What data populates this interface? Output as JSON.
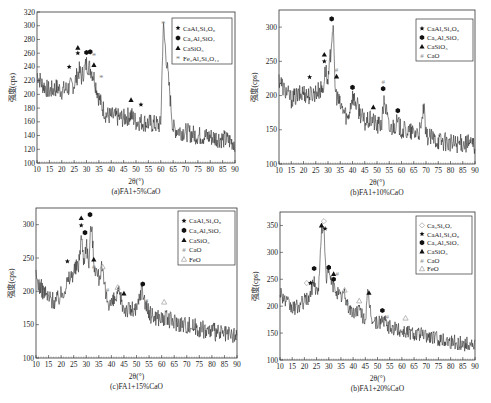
{
  "chart_data": [
    {
      "type": "line",
      "panel": "a",
      "caption": "(a)FA1+5%CaO",
      "xlabel": "2θ(°)",
      "ylabel": "强度(cps)",
      "xlim": [
        10,
        90
      ],
      "ylim": [
        100,
        320
      ],
      "xticks": [
        10,
        15,
        20,
        25,
        30,
        35,
        40,
        45,
        50,
        55,
        60,
        65,
        70,
        75,
        80,
        85,
        90
      ],
      "yticks": [
        100,
        120,
        140,
        160,
        180,
        200,
        220,
        240,
        260,
        280,
        300,
        320
      ],
      "grid": false,
      "legend_position": "upper right",
      "legend": [
        {
          "marker": "star",
          "label": "CaAl₂Si₂O₈"
        },
        {
          "marker": "hexagon",
          "label": "Ca₂Al₂SiO₇"
        },
        {
          "marker": "triangle",
          "label": "CaSiO₃"
        },
        {
          "marker": "asterisk-gray",
          "label": "Fe₃Al₂Si₃O₁₂"
        }
      ],
      "series": [
        {
          "name": "XRD pattern",
          "x": [
            10,
            12,
            15,
            18,
            20,
            23,
            25,
            27,
            28,
            30,
            31,
            32,
            33,
            34,
            35,
            36,
            38,
            40,
            45,
            48,
            50,
            52,
            55,
            60,
            61,
            65,
            70,
            75,
            80,
            85,
            90
          ],
          "values": [
            230,
            215,
            205,
            210,
            205,
            210,
            215,
            235,
            225,
            245,
            240,
            235,
            225,
            210,
            195,
            185,
            170,
            168,
            165,
            170,
            160,
            160,
            158,
            155,
            300,
            150,
            145,
            140,
            138,
            135,
            130
          ]
        }
      ],
      "annotations": [
        {
          "x": 23,
          "y": 240,
          "marker": "star"
        },
        {
          "x": 26.5,
          "y": 268,
          "marker": "triangle"
        },
        {
          "x": 26.5,
          "y": 260,
          "marker": "star"
        },
        {
          "x": 30,
          "y": 261,
          "marker": "hexagon"
        },
        {
          "x": 31.5,
          "y": 262,
          "marker": "hexagon"
        },
        {
          "x": 33,
          "y": 256,
          "marker": "asterisk-gray"
        },
        {
          "x": 33,
          "y": 243,
          "marker": "triangle"
        },
        {
          "x": 36,
          "y": 225,
          "marker": "asterisk-gray"
        },
        {
          "x": 48,
          "y": 192,
          "marker": "triangle"
        },
        {
          "x": 52,
          "y": 185,
          "marker": "star"
        },
        {
          "x": 61,
          "y": 303,
          "marker": "asterisk-gray"
        }
      ]
    },
    {
      "type": "line",
      "panel": "b",
      "caption": "(b)FA1+10%CaO",
      "xlabel": "2θ(°)",
      "ylabel": "强度(cps)",
      "xlim": [
        10,
        90
      ],
      "ylim": [
        100,
        325
      ],
      "xticks": [
        10,
        15,
        20,
        25,
        30,
        35,
        40,
        45,
        50,
        55,
        60,
        65,
        70,
        75,
        80,
        85,
        90
      ],
      "yticks": [
        100,
        150,
        200,
        250,
        300
      ],
      "grid": false,
      "legend_position": "upper right",
      "legend": [
        {
          "marker": "star",
          "label": "CaAl₂Si₂O₈"
        },
        {
          "marker": "hexagon",
          "label": "Ca₂Al₂SiO₇"
        },
        {
          "marker": "triangle",
          "label": "CaSiO₃"
        },
        {
          "marker": "hash",
          "label": "CaO"
        }
      ],
      "series": [
        {
          "name": "XRD pattern",
          "x": [
            10,
            12,
            15,
            18,
            20,
            22,
            25,
            28,
            29,
            30,
            32,
            33,
            35,
            37,
            38,
            40,
            45,
            48,
            50,
            52,
            53,
            55,
            58,
            60,
            65,
            68,
            69,
            70,
            75,
            80,
            85,
            90
          ],
          "values": [
            225,
            210,
            195,
            200,
            205,
            200,
            205,
            210,
            240,
            215,
            305,
            205,
            185,
            175,
            165,
            200,
            160,
            165,
            155,
            160,
            195,
            150,
            160,
            150,
            145,
            148,
            185,
            140,
            135,
            130,
            130,
            128
          ]
        }
      ],
      "annotations": [
        {
          "x": 22.5,
          "y": 227,
          "marker": "star"
        },
        {
          "x": 28.5,
          "y": 260,
          "marker": "triangle"
        },
        {
          "x": 28.5,
          "y": 250,
          "marker": "star"
        },
        {
          "x": 31.5,
          "y": 312,
          "marker": "hexagon"
        },
        {
          "x": 33.5,
          "y": 238,
          "marker": "hash"
        },
        {
          "x": 33.5,
          "y": 228,
          "marker": "triangle"
        },
        {
          "x": 40,
          "y": 212,
          "marker": "hexagon"
        },
        {
          "x": 48.5,
          "y": 183,
          "marker": "triangle"
        },
        {
          "x": 52.5,
          "y": 220,
          "marker": "hash"
        },
        {
          "x": 52.5,
          "y": 210,
          "marker": "hexagon"
        },
        {
          "x": 58.5,
          "y": 178,
          "marker": "hexagon"
        }
      ]
    },
    {
      "type": "line",
      "panel": "c",
      "caption": "(c)FA1+15%CaO",
      "xlabel": "2θ(°)",
      "ylabel": "强度(cps)",
      "xlim": [
        10,
        90
      ],
      "ylim": [
        100,
        325
      ],
      "xticks": [
        10,
        15,
        20,
        25,
        30,
        35,
        40,
        45,
        50,
        55,
        60,
        65,
        70,
        75,
        80,
        85,
        90
      ],
      "yticks": [
        100,
        150,
        200,
        250,
        300
      ],
      "grid": false,
      "legend_position": "upper right",
      "legend": [
        {
          "marker": "star",
          "label": "CaAl₂Si₂O₈"
        },
        {
          "marker": "hexagon",
          "label": "Ca₂Al₂SiO₇"
        },
        {
          "marker": "triangle",
          "label": "CaSiO₃"
        },
        {
          "marker": "hash",
          "label": "CaO"
        },
        {
          "marker": "triangle-open",
          "label": "FeO"
        }
      ],
      "series": [
        {
          "name": "XRD pattern",
          "x": [
            10,
            12,
            15,
            18,
            20,
            22,
            25,
            27,
            28,
            29,
            30,
            31,
            32,
            33,
            34,
            35,
            36,
            38,
            40,
            43,
            45,
            48,
            50,
            52,
            55,
            60,
            65,
            70,
            75,
            80,
            85,
            90
          ],
          "values": [
            220,
            205,
            190,
            185,
            195,
            210,
            230,
            240,
            285,
            245,
            275,
            240,
            305,
            245,
            230,
            220,
            235,
            190,
            180,
            195,
            175,
            172,
            170,
            205,
            165,
            160,
            155,
            150,
            145,
            140,
            135,
            132
          ]
        }
      ],
      "annotations": [
        {
          "x": 22.5,
          "y": 245,
          "marker": "star"
        },
        {
          "x": 28,
          "y": 310,
          "marker": "triangle"
        },
        {
          "x": 28,
          "y": 299,
          "marker": "star"
        },
        {
          "x": 29.5,
          "y": 288,
          "marker": "hexagon"
        },
        {
          "x": 31.5,
          "y": 315,
          "marker": "hexagon"
        },
        {
          "x": 33,
          "y": 248,
          "marker": "triangle"
        },
        {
          "x": 33,
          "y": 238,
          "marker": "hash"
        },
        {
          "x": 36.5,
          "y": 237,
          "marker": "triangle-open"
        },
        {
          "x": 38.5,
          "y": 203,
          "marker": "hash"
        },
        {
          "x": 42.5,
          "y": 206,
          "marker": "triangle-open"
        },
        {
          "x": 45,
          "y": 197,
          "marker": "triangle"
        },
        {
          "x": 52.5,
          "y": 211,
          "marker": "hexagon"
        },
        {
          "x": 54,
          "y": 187,
          "marker": "hash"
        },
        {
          "x": 61,
          "y": 184,
          "marker": "triangle-open"
        }
      ]
    },
    {
      "type": "line",
      "panel": "d",
      "caption": "(b)FA1+20%CaO",
      "xlabel": "2θ(°)",
      "ylabel": "强度(cps)",
      "xlim": [
        10,
        90
      ],
      "ylim": [
        100,
        375
      ],
      "xticks": [
        10,
        15,
        20,
        25,
        30,
        35,
        40,
        45,
        50,
        55,
        60,
        65,
        70,
        75,
        80,
        85,
        90
      ],
      "yticks": [
        100,
        150,
        200,
        250,
        300,
        350
      ],
      "grid": false,
      "legend_position": "upper right",
      "legend": [
        {
          "marker": "diamond-open",
          "label": "Ca₃Si₂O₇"
        },
        {
          "marker": "star",
          "label": "CaAl₂Si₂O₈"
        },
        {
          "marker": "hexagon",
          "label": "Ca₂Al₂SiO₇"
        },
        {
          "marker": "triangle",
          "label": "CaSiO₃"
        },
        {
          "marker": "hash",
          "label": "CaO"
        },
        {
          "marker": "triangle-open",
          "label": "FeO"
        }
      ],
      "series": [
        {
          "name": "XRD pattern",
          "x": [
            10,
            12,
            15,
            18,
            20,
            22,
            24,
            25,
            26,
            27,
            28,
            29,
            30,
            31,
            32,
            33,
            35,
            36,
            38,
            40,
            42,
            45,
            46,
            48,
            50,
            52,
            55,
            60,
            65,
            70,
            75,
            80,
            85,
            90
          ],
          "values": [
            230,
            210,
            195,
            200,
            210,
            215,
            250,
            225,
            240,
            345,
            340,
            255,
            265,
            245,
            235,
            230,
            215,
            225,
            200,
            185,
            195,
            175,
            220,
            172,
            168,
            175,
            160,
            155,
            150,
            145,
            140,
            135,
            130,
            128
          ]
        }
      ],
      "annotations": [
        {
          "x": 21,
          "y": 243,
          "marker": "diamond-open"
        },
        {
          "x": 22.5,
          "y": 243,
          "marker": "star"
        },
        {
          "x": 24,
          "y": 270,
          "marker": "hexagon"
        },
        {
          "x": 27,
          "y": 350,
          "marker": "triangle"
        },
        {
          "x": 28,
          "y": 358,
          "marker": "diamond-open"
        },
        {
          "x": 28.5,
          "y": 344,
          "marker": "star"
        },
        {
          "x": 30,
          "y": 272,
          "marker": "hexagon"
        },
        {
          "x": 32,
          "y": 260,
          "marker": "triangle"
        },
        {
          "x": 32,
          "y": 250,
          "marker": "hexagon"
        },
        {
          "x": 33.5,
          "y": 260,
          "marker": "hash"
        },
        {
          "x": 36.5,
          "y": 230,
          "marker": "triangle-open"
        },
        {
          "x": 37.5,
          "y": 206,
          "marker": "hash"
        },
        {
          "x": 42.5,
          "y": 210,
          "marker": "triangle-open"
        },
        {
          "x": 46.5,
          "y": 225,
          "marker": "triangle"
        },
        {
          "x": 52,
          "y": 192,
          "marker": "hexagon"
        },
        {
          "x": 54,
          "y": 180,
          "marker": "hash"
        },
        {
          "x": 61.5,
          "y": 178,
          "marker": "triangle-open"
        }
      ]
    }
  ],
  "panels": [
    {
      "caption": "(a)FA1+5%CaO",
      "xlabel": "2θ(°)",
      "ylabel": "强度(cps)"
    },
    {
      "caption": "(b)FA1+10%CaO",
      "xlabel": "2θ(°)",
      "ylabel": "强度(cps)"
    },
    {
      "caption": "(c)FA1+15%CaO",
      "xlabel": "2θ(°)",
      "ylabel": "强度(cps)"
    },
    {
      "caption": "(b)FA1+20%CaO",
      "xlabel": "2θ(°)",
      "ylabel": "强度(cps)"
    }
  ]
}
